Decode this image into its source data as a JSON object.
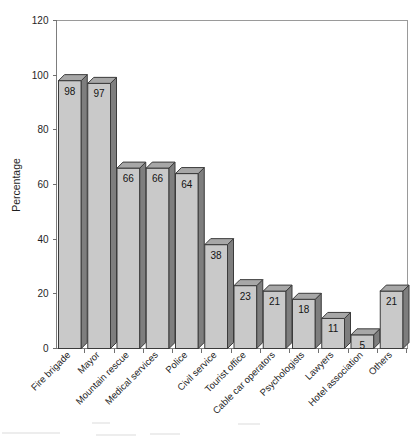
{
  "chart_data": {
    "type": "bar",
    "title": "",
    "subtitle": "",
    "xlabel": "",
    "ylabel": "Percentage",
    "ylim": [
      0,
      120
    ],
    "yticks": [
      0,
      20,
      40,
      60,
      80,
      100,
      120
    ],
    "ytick_labels": [
      "0",
      "20",
      "40",
      "60",
      "80",
      "100",
      "120"
    ],
    "grid": false,
    "legend": false,
    "legend_position": "none",
    "bar_style": "3d",
    "value_labels_inside_bars": true,
    "categories": [
      "Fire brigade",
      "Mayor",
      "Mountain rescue",
      "Medical services",
      "Police",
      "Civil service",
      "Tourist office",
      "Cable car operators",
      "Psychologists",
      "Lawyers",
      "Hotel association",
      "Others"
    ],
    "values": [
      98,
      97,
      66,
      66,
      64,
      38,
      23,
      21,
      18,
      11,
      5,
      21
    ],
    "value_label_texts": [
      "98",
      "97",
      "66",
      "66",
      "64",
      "38",
      "23",
      "21",
      "18",
      "11",
      "5",
      "21"
    ],
    "colors": {
      "bar_front": "#c9c9c9",
      "bar_side": "#7e7e7e",
      "bar_top": "#a7a7a7",
      "bar_outline": "#3b3b3b",
      "axis": "#7d7d7d",
      "text": "#1f1f1f",
      "background": "#ffffff"
    }
  },
  "axes": {
    "y_title": "Percentage"
  }
}
